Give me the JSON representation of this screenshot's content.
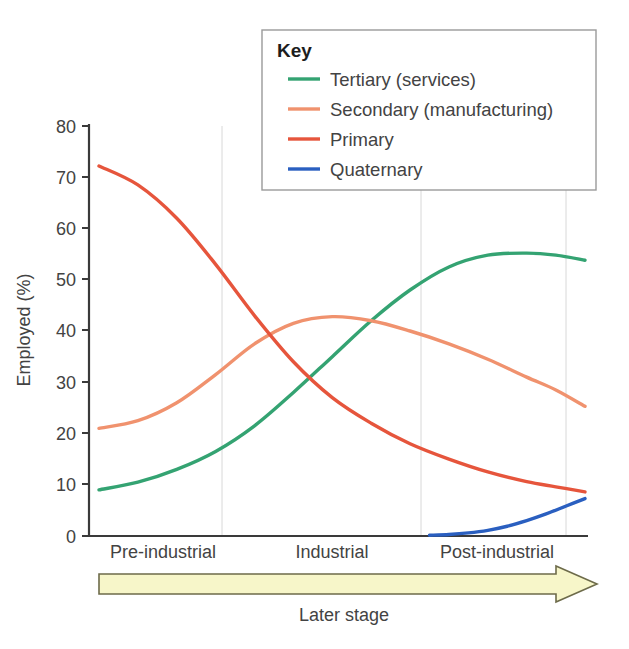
{
  "chart_data": {
    "type": "line",
    "title": "",
    "xlabel": "Later stage",
    "ylabel": "Employed (%)",
    "xlim": [
      0,
      100
    ],
    "ylim": [
      0,
      80
    ],
    "grid": "vertical-only",
    "y_ticks": [
      "80",
      "70",
      "60",
      "50",
      "40",
      "30",
      "20",
      "10",
      "0"
    ],
    "y_tick_values": [
      80,
      70,
      60,
      50,
      40,
      30,
      20,
      10,
      0
    ],
    "categories": [
      "Pre-industrial",
      "Industrial",
      "Post-industrial"
    ],
    "gridline_x_values": [
      25,
      65,
      95
    ],
    "legend": {
      "title": "Key",
      "position": "top-right-inside"
    },
    "series": [
      {
        "name": "Tertiary (services)",
        "color": "#34a372",
        "x": [
          0,
          8,
          16,
          24,
          32,
          40,
          48,
          56,
          64,
          72,
          80,
          88,
          94,
          100
        ],
        "values": [
          9,
          10.5,
          13,
          16.5,
          21.5,
          28,
          35,
          42,
          48,
          52.5,
          54.8,
          55.2,
          54.8,
          53.8
        ]
      },
      {
        "name": "Secondary (manufacturing)",
        "color": "#f0926e",
        "x": [
          0,
          8,
          16,
          24,
          32,
          40,
          48,
          56,
          64,
          72,
          80,
          88,
          94,
          100
        ],
        "values": [
          21,
          22.5,
          26,
          31.5,
          37.5,
          41.5,
          42.8,
          42,
          40,
          37.5,
          34.5,
          31,
          28.5,
          25.3
        ]
      },
      {
        "name": "Primary",
        "color": "#e6553c",
        "x": [
          0,
          8,
          16,
          24,
          32,
          40,
          48,
          56,
          64,
          72,
          80,
          88,
          94,
          100
        ],
        "values": [
          72.2,
          68.5,
          62,
          53,
          43,
          34,
          27,
          22,
          18,
          15,
          12.5,
          10.6,
          9.6,
          8.6
        ]
      },
      {
        "name": "Quaternary",
        "color": "#2a5fc0",
        "x": [
          68,
          72,
          76,
          80,
          84,
          88,
          92,
          96,
          100
        ],
        "values": [
          0.15,
          0.3,
          0.6,
          1.1,
          1.9,
          3.0,
          4.3,
          5.8,
          7.3
        ]
      }
    ],
    "annotations": [
      {
        "name": "later-stage-arrow",
        "label": "Later stage",
        "fill": "#f7f6c9",
        "stroke": "#6d6b4a",
        "direction": "right"
      }
    ]
  }
}
